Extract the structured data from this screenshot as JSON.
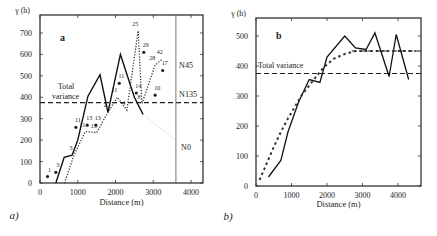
{
  "chart_data": [
    {
      "panel": "a",
      "panel_caption": "a)",
      "type": "line",
      "title": "a",
      "xlabel": "Distance (m)",
      "ylabel": "γ (h)",
      "xlim": [
        0,
        4300
      ],
      "ylim": [
        0,
        750
      ],
      "xticks": [
        0,
        1000,
        2000,
        3000,
        4000
      ],
      "yticks": [
        0,
        100,
        200,
        300,
        400,
        500,
        600,
        700
      ],
      "grid": false,
      "annotations": [
        "Total variance",
        "N45",
        "N135",
        "N0"
      ],
      "total_variance": 375,
      "series": [
        {
          "name": "N0",
          "style": "solid",
          "x": [
            420,
            640,
            850,
            1000,
            1270,
            1590,
            1800,
            2130,
            2500,
            2730
          ],
          "y": [
            0,
            120,
            130,
            200,
            405,
            505,
            330,
            600,
            400,
            320
          ]
        },
        {
          "name": "N45",
          "style": "dotted",
          "x": [
            650,
            900,
            1200,
            1500,
            1800,
            2050,
            2300,
            2600,
            2700,
            3050,
            3250
          ],
          "y": [
            0,
            130,
            240,
            235,
            330,
            400,
            340,
            710,
            370,
            550,
            580
          ],
          "point_labels": [
            "",
            "3",
            "11",
            "13",
            "2",
            "11",
            "4",
            "25",
            "8",
            "28",
            "42"
          ]
        },
        {
          "name": "N135",
          "style": "points",
          "x": [
            200,
            420,
            950,
            1250,
            1480,
            2100,
            2550,
            2750,
            3050,
            3250
          ],
          "y": [
            30,
            50,
            260,
            270,
            270,
            465,
            420,
            610,
            410,
            525
          ],
          "point_labels": [
            "1",
            "3",
            "11",
            "13",
            "13",
            "11",
            "14",
            "29",
            "10",
            "17"
          ]
        }
      ]
    },
    {
      "panel": "b",
      "panel_caption": "b)",
      "type": "line",
      "title": "b",
      "xlabel": "Distance (m)",
      "ylabel": "γ (h)",
      "xlim": [
        0,
        4500
      ],
      "ylim": [
        0,
        550
      ],
      "xticks": [
        0,
        1000,
        2000,
        3000,
        4000
      ],
      "yticks": [
        0,
        100,
        200,
        300,
        400,
        500
      ],
      "grid": false,
      "annotations": [
        "Total variance"
      ],
      "total_variance": 375,
      "sill": 450,
      "series": [
        {
          "name": "experimental",
          "style": "solid",
          "x": [
            350,
            700,
            900,
            1200,
            1500,
            1800,
            2000,
            2500,
            2800,
            3100,
            3350,
            3750,
            3950,
            4300
          ],
          "y": [
            30,
            85,
            180,
            280,
            355,
            345,
            430,
            500,
            460,
            455,
            510,
            365,
            505,
            355
          ]
        },
        {
          "name": "model",
          "style": "dashed",
          "x": [
            100,
            300,
            500,
            700,
            900,
            1100,
            1300,
            1600,
            1900,
            2200,
            2500,
            2800,
            4500
          ],
          "y": [
            20,
            75,
            130,
            180,
            225,
            265,
            305,
            350,
            395,
            425,
            440,
            450,
            450
          ]
        }
      ]
    }
  ],
  "labels": {
    "a_title": "a",
    "b_title": "b",
    "a_caption": "a)",
    "b_caption": "b)",
    "ylabel": "γ (h)",
    "xlabel": "Distance (m)",
    "total_variance_1": "Total",
    "total_variance_2": "variance",
    "total_variance": "Total variance",
    "n45": "N45",
    "n135": "N135",
    "n0": "N0"
  }
}
